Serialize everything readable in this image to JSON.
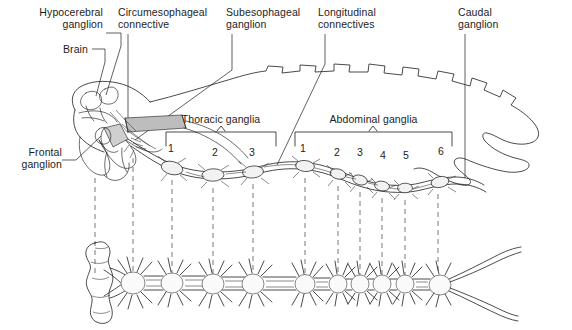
{
  "figure": {
    "width": 572,
    "height": 330,
    "background": "#ffffff",
    "ink": "#1d1d1d",
    "shade": "#b8b8b8"
  },
  "callouts": [
    {
      "id": "hypocerebral-ganglion",
      "label": "Hypocerebral\nganglion",
      "align": "right",
      "x": 103,
      "y": 8,
      "leader": "elbow-right-down"
    },
    {
      "id": "brain",
      "label": "Brain",
      "align": "right",
      "x": 88,
      "y": 44,
      "leader": "elbow-right-down"
    },
    {
      "id": "circumesophageal-connective",
      "label": "Circumesophageal\nconnective",
      "align": "left",
      "x": 118,
      "y": 8,
      "leader": "vertical"
    },
    {
      "id": "subesophageal-ganglion",
      "label": "Subesophageal\nganglion",
      "align": "left",
      "x": 226,
      "y": 8,
      "leader": "vertical-diagonal"
    },
    {
      "id": "longitudinal-connectives",
      "label": "Longitudinal\nconnectives",
      "align": "left",
      "x": 318,
      "y": 8,
      "leader": "vertical-diagonal"
    },
    {
      "id": "caudal-ganglion",
      "label": "Caudal\nganglion",
      "align": "left",
      "x": 458,
      "y": 8,
      "leader": "vertical"
    },
    {
      "id": "frontal-ganglion",
      "label": "Frontal\nganglion",
      "align": "right",
      "x": 14,
      "y": 147,
      "leader": "diagonal-right-up"
    }
  ],
  "brackets": [
    {
      "id": "thoracic-ganglia",
      "label": "Thoracic ganglia",
      "label_x": 220,
      "label_y": 114,
      "left": 166,
      "right": 276,
      "top": 130,
      "bottom": 146,
      "tick_x": 221,
      "numbers": [
        {
          "value": "1",
          "x": 171,
          "y": 148
        },
        {
          "value": "2",
          "x": 215,
          "y": 152
        },
        {
          "value": "3",
          "x": 251,
          "y": 152
        }
      ]
    },
    {
      "id": "abdominal-ganglia",
      "label": "Abdominal ganglia",
      "label_x": 374,
      "label_y": 114,
      "left": 295,
      "right": 452,
      "top": 130,
      "bottom": 146,
      "tick_x": 373,
      "numbers": [
        {
          "value": "1",
          "x": 302,
          "y": 148
        },
        {
          "value": "2",
          "x": 337,
          "y": 152
        },
        {
          "value": "3",
          "x": 360,
          "y": 152
        },
        {
          "value": "4",
          "x": 383,
          "y": 155
        },
        {
          "value": "5",
          "x": 406,
          "y": 155
        },
        {
          "value": "6",
          "x": 441,
          "y": 151
        }
      ]
    }
  ],
  "projection_lines": {
    "note": "dashed vertical correspondence lines between in-situ view and isolated nerve cord",
    "x_positions": [
      95,
      133,
      172,
      213,
      253,
      305,
      338,
      360,
      382,
      405,
      438
    ],
    "y_top": 150,
    "y_bottom": 275
  },
  "in_situ_view": {
    "id": "insect-body-outline",
    "description": "Lateral outline of insect body with head capsule, brain, nerve cord and segmental ganglia"
  },
  "isolated_cord": {
    "id": "isolated-nerve-cord",
    "description": "Isolated ventral nerve cord in dorsal aspect with paired lateral nerves",
    "ganglion_x": [
      133,
      172,
      213,
      253,
      305,
      338,
      360,
      382,
      405,
      438
    ],
    "baseline_y": 283
  }
}
